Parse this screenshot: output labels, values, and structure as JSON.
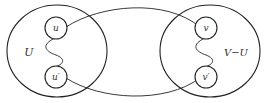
{
  "diagram": {
    "type": "graph-cut illustration",
    "stroke_color": "#222222",
    "background": "#ffffff",
    "sets": [
      {
        "id": "left-set",
        "label": "U"
      },
      {
        "id": "right-set",
        "label": "V−U"
      }
    ],
    "nodes": [
      {
        "id": "u",
        "label": "u",
        "set": "U"
      },
      {
        "id": "u-prime",
        "label": "u′",
        "set": "U"
      },
      {
        "id": "v",
        "label": "v",
        "set": "V−U"
      },
      {
        "id": "v-prime",
        "label": "v′",
        "set": "V−U"
      }
    ],
    "edges": [
      {
        "from": "u",
        "to": "v",
        "style": "arc-top"
      },
      {
        "from": "u-prime",
        "to": "v-prime",
        "style": "arc-bottom"
      },
      {
        "from": "u",
        "to": "u-prime",
        "style": "wavy-path"
      },
      {
        "from": "v",
        "to": "v-prime",
        "style": "wavy-path"
      }
    ]
  }
}
